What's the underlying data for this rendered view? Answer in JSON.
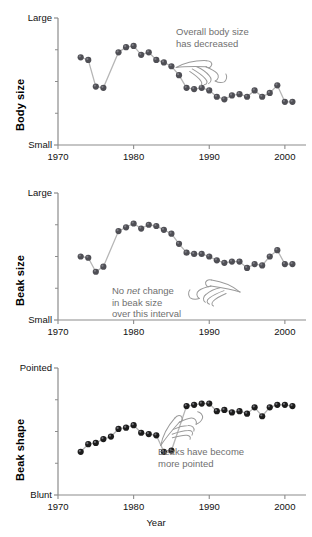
{
  "figure": {
    "background": "#ffffff",
    "marker_color": "#4f4f55",
    "marker_color_dark": "#1c1c1c",
    "line_color": "#b6b6b6",
    "axis_color": "#8c8c8c",
    "annotation_color": "#6f6f6f",
    "xlabel": "Year",
    "caption": ""
  },
  "chart_data": [
    {
      "type": "line",
      "title": "Body size",
      "ylabel": "Body size",
      "xlabel": "",
      "ylim": [
        0,
        1
      ],
      "ytick_labels": [
        "Small",
        "Large"
      ],
      "ytick_values": [
        0,
        1
      ],
      "ytick_minor": [
        0.25,
        0.5,
        0.75
      ],
      "xlim": [
        1970,
        2002
      ],
      "xtick_labels": [
        "1970",
        "1980",
        "1990",
        "2000"
      ],
      "xtick_values": [
        1970,
        1980,
        1990,
        2000
      ],
      "grid": false,
      "legend": "none",
      "annotation": "Overall body size\nhas decreased",
      "annotation_icon": "pointing-hand-down-left-icon",
      "x": [
        1973,
        1974,
        1975,
        1976,
        1978,
        1979,
        1980,
        1981,
        1982,
        1983,
        1984,
        1985,
        1986,
        1987,
        1988,
        1989,
        1990,
        1991,
        1992,
        1993,
        1994,
        1995,
        1996,
        1997,
        1998,
        1999,
        2000,
        2001
      ],
      "values": [
        0.69,
        0.67,
        0.46,
        0.45,
        0.73,
        0.77,
        0.78,
        0.71,
        0.73,
        0.67,
        0.65,
        0.62,
        0.55,
        0.45,
        0.44,
        0.45,
        0.43,
        0.38,
        0.36,
        0.39,
        0.4,
        0.38,
        0.43,
        0.38,
        0.41,
        0.47,
        0.34,
        0.34
      ]
    },
    {
      "type": "line",
      "title": "Beak size",
      "ylabel": "Beak size",
      "xlabel": "",
      "ylim": [
        0,
        1
      ],
      "ytick_labels": [
        "Small",
        "Large"
      ],
      "ytick_values": [
        0,
        1
      ],
      "ytick_minor": [
        0.25,
        0.5,
        0.75
      ],
      "xlim": [
        1970,
        2002
      ],
      "xtick_labels": [
        "1970",
        "1980",
        "1990",
        "2000"
      ],
      "xtick_values": [
        1970,
        1980,
        1990,
        2000
      ],
      "grid": false,
      "legend": "none",
      "annotation_parts": [
        "No ",
        "net",
        " change\nin beak size\nover this interval"
      ],
      "annotation": "No net change in beak size over this interval",
      "annotation_icon": "pointing-hand-right-icon",
      "x": [
        1973,
        1974,
        1975,
        1976,
        1978,
        1979,
        1980,
        1981,
        1982,
        1983,
        1984,
        1985,
        1986,
        1987,
        1988,
        1989,
        1990,
        1991,
        1992,
        1993,
        1994,
        1995,
        1996,
        1997,
        1998,
        1999,
        2000,
        2001
      ],
      "values": [
        0.5,
        0.49,
        0.38,
        0.42,
        0.7,
        0.73,
        0.76,
        0.72,
        0.75,
        0.74,
        0.71,
        0.68,
        0.6,
        0.53,
        0.52,
        0.52,
        0.5,
        0.47,
        0.45,
        0.46,
        0.46,
        0.41,
        0.44,
        0.43,
        0.5,
        0.55,
        0.44,
        0.44
      ]
    },
    {
      "type": "line",
      "title": "Beak shape",
      "ylabel": "Beak shape",
      "xlabel": "Year",
      "ylim": [
        0,
        1
      ],
      "ytick_labels": [
        "Blunt",
        "Pointed"
      ],
      "ytick_values": [
        0,
        1
      ],
      "ytick_minor": [
        0.25,
        0.5,
        0.75
      ],
      "xlim": [
        1970,
        2002
      ],
      "xtick_labels": [
        "1970",
        "1980",
        "1990",
        "2000"
      ],
      "xtick_values": [
        1970,
        1980,
        1990,
        2000
      ],
      "grid": false,
      "legend": "none",
      "annotation": "Beaks have become\nmore pointed",
      "annotation_icon": "pointing-hand-up-right-icon",
      "x": [
        1973,
        1974,
        1975,
        1976,
        1977,
        1978,
        1979,
        1980,
        1981,
        1982,
        1983,
        1984,
        1985,
        1987,
        1988,
        1989,
        1990,
        1991,
        1992,
        1993,
        1994,
        1995,
        1996,
        1997,
        1998,
        1999,
        2000,
        2001
      ],
      "values": [
        0.34,
        0.4,
        0.41,
        0.44,
        0.46,
        0.52,
        0.53,
        0.55,
        0.49,
        0.48,
        0.47,
        0.34,
        0.35,
        0.7,
        0.71,
        0.72,
        0.72,
        0.66,
        0.67,
        0.65,
        0.66,
        0.64,
        0.69,
        0.62,
        0.69,
        0.71,
        0.71,
        0.7
      ]
    }
  ]
}
